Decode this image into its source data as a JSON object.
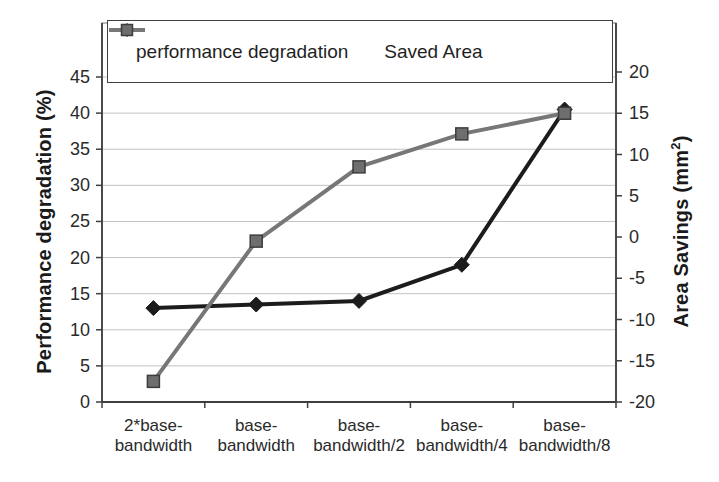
{
  "figure": {
    "background": "#ffffff",
    "legend": {
      "items": [
        {
          "id": "performance",
          "label": "performance degradation"
        },
        {
          "id": "saved_area",
          "label": "Saved Area"
        }
      ]
    },
    "right_axis_title": {
      "prefix": "Area Savings (mm",
      "superscript": "2",
      "suffix": ")"
    }
  },
  "chart_data": {
    "type": "line",
    "categories": [
      "2*base-bandwidth",
      "base-bandwidth",
      "base-bandwidth/2",
      "base-bandwidth/4",
      "base-bandwidth/8"
    ],
    "category_labels": [
      "2*base-\nbandwidth",
      "base-\nbandwidth",
      "base-\nbandwidth/2",
      "base-\nbandwidth/4",
      "base-\nbandwidth/8"
    ],
    "series": [
      {
        "name": "performance degradation",
        "axis": "left",
        "marker": "diamond",
        "color": "#1c1c1c",
        "marker_fill": "#1c1c1c",
        "marker_border": "#1c1c1c",
        "values": [
          13,
          13.5,
          14,
          19,
          40.5
        ]
      },
      {
        "name": "Saved Area",
        "axis": "right",
        "marker": "square",
        "color": "#777777",
        "marker_fill": "#6e6e6e",
        "marker_border": "#3d3d3d",
        "values": [
          -17.5,
          -0.5,
          8.5,
          12.5,
          15
        ]
      }
    ],
    "left_axis": {
      "label": "Performance degradation (%)",
      "min": 0,
      "max": 45,
      "step": 5,
      "ticks": [
        0,
        5,
        10,
        15,
        20,
        25,
        30,
        35,
        40,
        45
      ]
    },
    "right_axis": {
      "label": "Area Savings (mm2)",
      "min": -20,
      "max": 20,
      "step": 5,
      "ticks": [
        -20,
        -15,
        -10,
        -5,
        0,
        5,
        10,
        15,
        20
      ]
    },
    "grid": "horizontal",
    "legend_position": "top-inside"
  },
  "colors": {
    "grid": "#c2c2c2",
    "frame": "#8c8c8c",
    "axis": "#3f3f3f",
    "text": "#2a2a2a",
    "background": "#ffffff"
  }
}
